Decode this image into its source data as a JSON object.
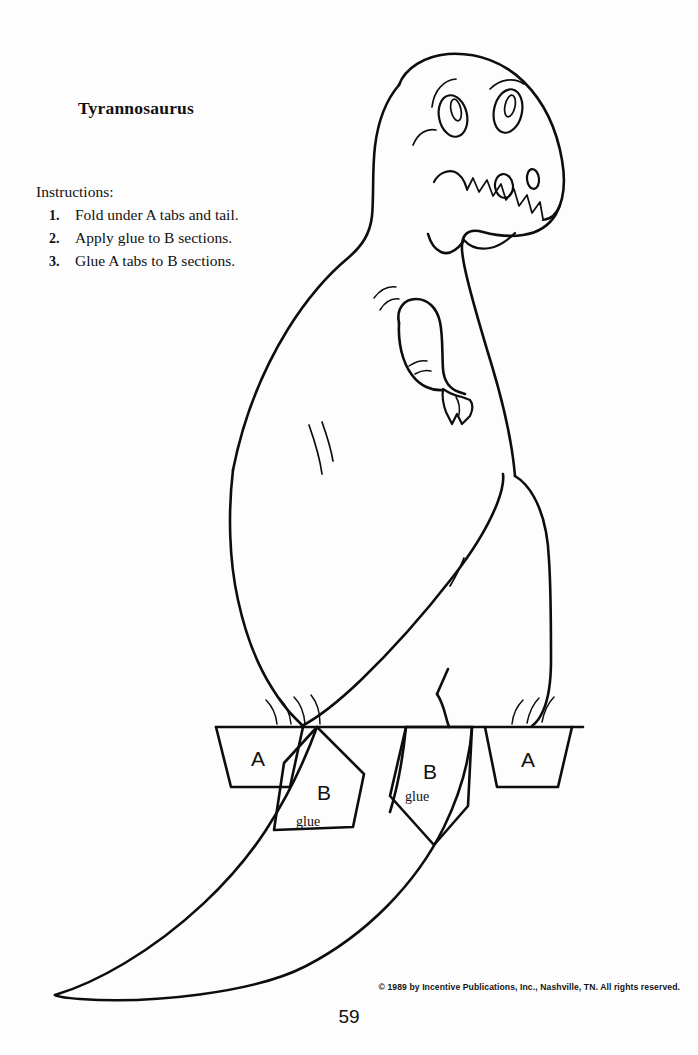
{
  "page": {
    "title": "Tyrannosaurus",
    "page_number": "59",
    "copyright": "© 1989 by Incentive Publications, Inc., Nashville, TN. All rights reserved.",
    "background_color": "#fdfdfd",
    "ink_color": "#0d0d0d"
  },
  "instructions": {
    "heading": "Instructions:",
    "items": [
      {
        "number": "1.",
        "text": "Fold under A tabs and tail."
      },
      {
        "number": "2.",
        "text": "Apply glue to B sections."
      },
      {
        "number": "3.",
        "text": "Glue A tabs to B sections."
      }
    ]
  },
  "craft_labels": {
    "tab_a_left": "A",
    "tab_a_right": "A",
    "tab_b_left": "B",
    "tab_b_right": "B",
    "glue_left": "glue",
    "glue_right": "glue"
  },
  "figure": {
    "parts": [
      "head",
      "eye-left",
      "eye-right",
      "eyebrow-left",
      "eyebrow-right",
      "nostril-large",
      "nostril-small",
      "mouth",
      "teeth",
      "jaw",
      "neck",
      "back",
      "belly",
      "arm",
      "claw",
      "leg-front",
      "leg-back",
      "foot-left",
      "foot-right",
      "tail",
      "fold-line"
    ]
  }
}
